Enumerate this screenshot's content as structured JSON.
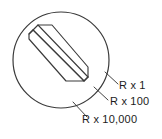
{
  "figure": {
    "type": "technical-detail-diagram",
    "line_color": "#3a3a3a",
    "text_color": "#1c1c1c",
    "background_color": "#ffffff",
    "detail_circle": {
      "center_x": 61,
      "center_y": 60,
      "radius": 48
    },
    "callouts": [
      {
        "id": "r-x-1",
        "label": "R x 1",
        "leader_from_x": 106,
        "leader_from_y": 73,
        "leader_to_x": 118,
        "leader_to_y": 84
      },
      {
        "id": "r-x-100",
        "label": "R x 100",
        "leader_from_x": 95,
        "leader_from_y": 88,
        "leader_to_x": 108,
        "leader_to_y": 100
      },
      {
        "id": "r-x-10000",
        "label": "R x 10,000",
        "leader_from_x": 74,
        "leader_from_y": 103,
        "leader_to_x": 87,
        "leader_to_y": 117
      }
    ]
  }
}
